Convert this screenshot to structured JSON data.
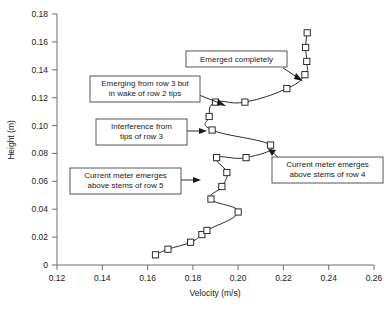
{
  "chart_data": {
    "type": "line",
    "title": "",
    "xlabel": "Velocity (m/s)",
    "ylabel": "Height (m)",
    "xlim": [
      0.12,
      0.26
    ],
    "ylim": [
      0.0,
      0.18
    ],
    "xticks": [
      0.12,
      0.14,
      0.16,
      0.18,
      0.2,
      0.22,
      0.24,
      0.26
    ],
    "xtick_labels": [
      "0.12",
      "0.14",
      "0.16",
      "0.18",
      "0.20",
      "0.22",
      "0.24",
      "0.26"
    ],
    "yticks": [
      0.0,
      0.02,
      0.04,
      0.06,
      0.08,
      0.1,
      0.12,
      0.14,
      0.16,
      0.18
    ],
    "ytick_labels": [
      "0",
      "0.02",
      "0.04",
      "0.06",
      "0.08",
      "0.10",
      "0.12",
      "0.14",
      "0.16",
      "0.18"
    ],
    "grid": false,
    "legend": null,
    "marker": "open-square",
    "series": [
      {
        "name": "Velocity profile",
        "x": [
          0.1635,
          0.169,
          0.179,
          0.184,
          0.1862,
          0.2,
          0.188,
          0.1928,
          0.195,
          0.1905,
          0.2035,
          0.2143,
          0.1885,
          0.1872,
          0.19,
          0.203,
          0.2215,
          0.2295,
          0.2303,
          0.2298,
          0.2305
        ],
        "y": [
          0.0073,
          0.0113,
          0.0163,
          0.0218,
          0.0248,
          0.038,
          0.0473,
          0.0563,
          0.0663,
          0.077,
          0.077,
          0.086,
          0.0968,
          0.1065,
          0.1168,
          0.1168,
          0.1265,
          0.1365,
          0.146,
          0.156,
          0.1665
        ]
      }
    ],
    "annotations": [
      {
        "id": "emerged-completely",
        "text_lines": [
          "Emerged completely"
        ],
        "target_x": 0.2295,
        "target_y": 0.1365
      },
      {
        "id": "emerging-row-3",
        "text_lines": [
          "Emerging from row 3 but",
          "in wake of row 2 tips"
        ],
        "target_x": 0.1965,
        "target_y": 0.119
      },
      {
        "id": "interference-row-3",
        "text_lines": [
          "Interference from",
          "tips of row 3"
        ],
        "target_x": 0.1885,
        "target_y": 0.0968
      },
      {
        "id": "meter-emerges-row-5",
        "text_lines": [
          "Current meter emerges",
          "above stems of row 5"
        ],
        "target_x": 0.195,
        "target_y": 0.0663
      },
      {
        "id": "meter-emerges-row-4",
        "text_lines": [
          "Current meter emerges",
          "above stems of row 4"
        ],
        "target_x": 0.2143,
        "target_y": 0.086
      }
    ],
    "colors": {
      "line": "#2b2b2b",
      "marker_fill": "#ffffff",
      "marker_stroke": "#2b2b2b",
      "axis": "#6d6d6d",
      "text": "#1a1a1a",
      "annotation_border": "#555555",
      "background": "#ffffff"
    }
  }
}
